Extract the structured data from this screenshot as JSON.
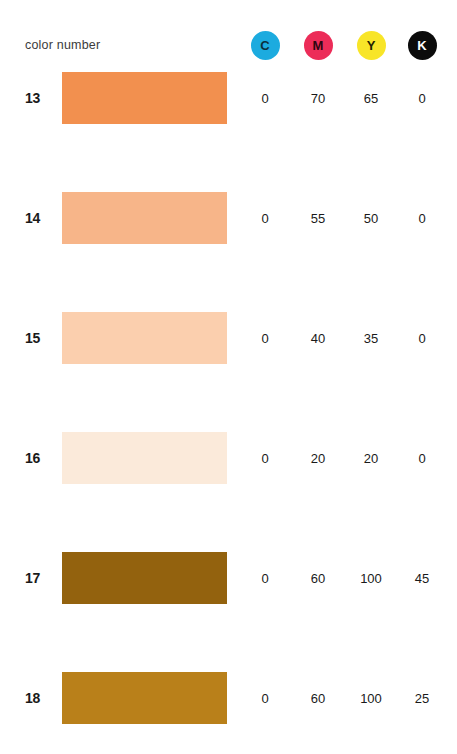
{
  "header": {
    "label": "color number",
    "inks": [
      {
        "name": "cyan",
        "letter": "C",
        "dot_color": "#1cabdf",
        "text_color": "#0b2f3e",
        "center_x": 265
      },
      {
        "name": "magenta",
        "letter": "M",
        "dot_color": "#ec2c58",
        "text_color": "#2b0610",
        "center_x": 318
      },
      {
        "name": "yellow",
        "letter": "Y",
        "dot_color": "#f8e528",
        "text_color": "#211f00",
        "center_x": 371
      },
      {
        "name": "black",
        "letter": "K",
        "dot_color": "#0b0b0b",
        "text_color": "#ffffff",
        "center_x": 422
      }
    ]
  },
  "chart_data": {
    "type": "table",
    "title": "color number",
    "columns": [
      "color number",
      "swatch",
      "C",
      "M",
      "Y",
      "K"
    ],
    "rows": [
      {
        "number": "13",
        "swatch_color": "#f2904f",
        "c": "0",
        "m": "70",
        "y": "65",
        "k": "0",
        "top": 72
      },
      {
        "number": "14",
        "swatch_color": "#f7b589",
        "c": "0",
        "m": "55",
        "y": "50",
        "k": "0",
        "top": 192
      },
      {
        "number": "15",
        "swatch_color": "#fbcfae",
        "c": "0",
        "m": "40",
        "y": "35",
        "k": "0",
        "top": 312
      },
      {
        "number": "16",
        "swatch_color": "#fbeada",
        "c": "0",
        "m": "20",
        "y": "20",
        "k": "0",
        "top": 432
      },
      {
        "number": "17",
        "swatch_color": "#93620e",
        "c": "0",
        "m": "60",
        "y": "100",
        "k": "45",
        "top": 552
      },
      {
        "number": "18",
        "swatch_color": "#b9801a",
        "c": "0",
        "m": "60",
        "y": "100",
        "k": "25",
        "top": 672
      }
    ]
  }
}
